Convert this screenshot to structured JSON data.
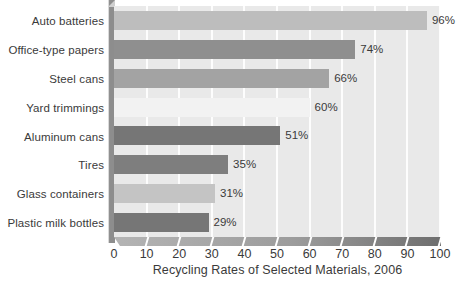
{
  "chart_data": {
    "type": "bar",
    "orientation": "horizontal",
    "title": "Recycling Rates of Selected Materials, 2006",
    "xlabel": "Recycling Rates of Selected Materials, 2006",
    "ylabel": "",
    "xlim": [
      0,
      100
    ],
    "xticks": [
      0,
      10,
      20,
      30,
      40,
      50,
      60,
      70,
      80,
      90,
      100
    ],
    "xtick_labels": [
      "0",
      "10",
      "20",
      "30",
      "40",
      "50",
      "60",
      "70",
      "80",
      "90",
      "100"
    ],
    "grid": true,
    "grid_axis": "x",
    "legend": false,
    "value_suffix": "%",
    "categories": [
      "Auto batteries",
      "Office-type papers",
      "Steel cans",
      "Yard trimmings",
      "Aluminum cans",
      "Tires",
      "Glass containers",
      "Plastic milk bottles"
    ],
    "values": [
      96,
      74,
      66,
      60,
      51,
      35,
      31,
      29
    ],
    "value_labels": [
      "96%",
      "74%",
      "66%",
      "60%",
      "51%",
      "35%",
      "31%",
      "29%"
    ],
    "bar_colors": [
      "#bdbdbd",
      "#8f8f8f",
      "#a3a3a3",
      "#f2f2f2",
      "#767676",
      "#7e7e7e",
      "#c4c4c4",
      "#767676"
    ]
  },
  "colors": {
    "plot_background": "#e9e9e9",
    "gridline": "#fdfdfd",
    "axis": "#8d8d8d",
    "text": "#3a3a3a",
    "page_background": "#ffffff"
  }
}
